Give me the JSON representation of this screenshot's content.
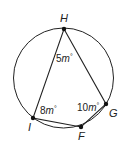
{
  "diagram": {
    "type": "inscribed-quadrilateral",
    "circle": {
      "cx": 63.5,
      "cy": 78,
      "r": 50
    },
    "points": [
      {
        "name": "H",
        "x": 64,
        "y": 29
      },
      {
        "name": "G",
        "x": 106,
        "y": 104
      },
      {
        "name": "F",
        "x": 81,
        "y": 127
      },
      {
        "name": "I",
        "x": 33,
        "y": 118
      }
    ],
    "angles": [
      {
        "vertex": "H",
        "coef": "5",
        "var": "m",
        "unit": "°"
      },
      {
        "vertex": "G",
        "coef": "10",
        "var": "m",
        "unit": "°"
      },
      {
        "vertex": "I",
        "coef": "8",
        "var": "m",
        "unit": "°"
      }
    ],
    "labels": {
      "H": "H",
      "G": "G",
      "F": "F",
      "I": "I"
    }
  }
}
